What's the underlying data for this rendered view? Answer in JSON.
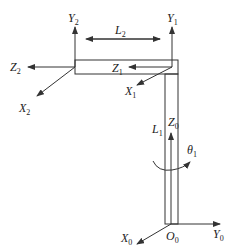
{
  "diagram": {
    "type": "robot-arm-coordinate-frames",
    "stroke_color": "#333333",
    "frames": {
      "frame0": {
        "x": {
          "main": "X",
          "sub": "0"
        },
        "y": {
          "main": "Y",
          "sub": "0"
        },
        "z": {
          "main": "Z",
          "sub": "0"
        },
        "origin": {
          "main": "O",
          "sub": "0"
        }
      },
      "frame1": {
        "x": {
          "main": "X",
          "sub": "1"
        },
        "y": {
          "main": "Y",
          "sub": "1"
        },
        "z": {
          "main": "Z",
          "sub": "1"
        }
      },
      "frame2": {
        "x": {
          "main": "X",
          "sub": "2"
        },
        "y": {
          "main": "Y",
          "sub": "2"
        },
        "z": {
          "main": "Z",
          "sub": "2"
        }
      }
    },
    "links": {
      "l1": {
        "main": "L",
        "sub": "1"
      },
      "l2": {
        "main": "L",
        "sub": "2"
      }
    },
    "joint_angle": {
      "main": "θ",
      "sub": "1"
    }
  }
}
